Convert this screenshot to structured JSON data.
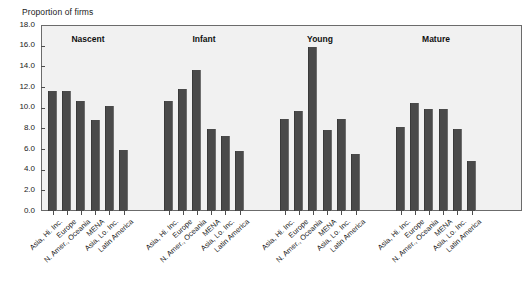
{
  "chart_data": {
    "type": "bar",
    "title": "Proportion of firms",
    "xlabel": "",
    "ylabel": "Proportion of firms",
    "ylim": [
      0.0,
      18.0
    ],
    "ytick_labels": [
      "18.0",
      "16.0",
      "14.0",
      "12.0",
      "10.0",
      "8.0",
      "6.0",
      "4.0",
      "2.0",
      "0.0"
    ],
    "ytick_values": [
      18.0,
      16.0,
      14.0,
      12.0,
      10.0,
      8.0,
      6.0,
      4.0,
      2.0,
      0.0
    ],
    "grid": false,
    "legend": "none",
    "categories": [
      "Asia, Hi. Inc.",
      "Europe",
      "N. Amer., Oceania",
      "MENA",
      "Asia, Lo. Inc.",
      "Latin America"
    ],
    "groups": [
      {
        "name": "Nascent",
        "values": [
          11.6,
          11.6,
          10.6,
          8.8,
          10.2,
          5.9
        ]
      },
      {
        "name": "Infant",
        "values": [
          10.6,
          11.8,
          13.6,
          7.9,
          7.3,
          5.8
        ]
      },
      {
        "name": "Young",
        "values": [
          8.9,
          9.7,
          15.9,
          7.8,
          8.9,
          5.5
        ]
      },
      {
        "name": "Mature",
        "values": [
          8.1,
          10.5,
          9.9,
          9.9,
          7.9,
          4.8
        ]
      }
    ],
    "series": [
      {
        "name": "Nascent",
        "values": [
          11.6,
          11.6,
          10.6,
          8.8,
          10.2,
          5.9
        ]
      },
      {
        "name": "Infant",
        "values": [
          10.6,
          11.8,
          13.6,
          7.9,
          7.3,
          5.8
        ]
      },
      {
        "name": "Young",
        "values": [
          8.9,
          9.7,
          15.9,
          7.8,
          8.9,
          5.5
        ]
      },
      {
        "name": "Mature",
        "values": [
          8.1,
          10.5,
          9.9,
          9.9,
          7.9,
          4.8
        ]
      }
    ],
    "colors": {
      "bar": "#4a4a4a",
      "plot_background": "#f1f1f1",
      "frame": "#6b6b6b",
      "text": "#1a1a1a"
    }
  }
}
